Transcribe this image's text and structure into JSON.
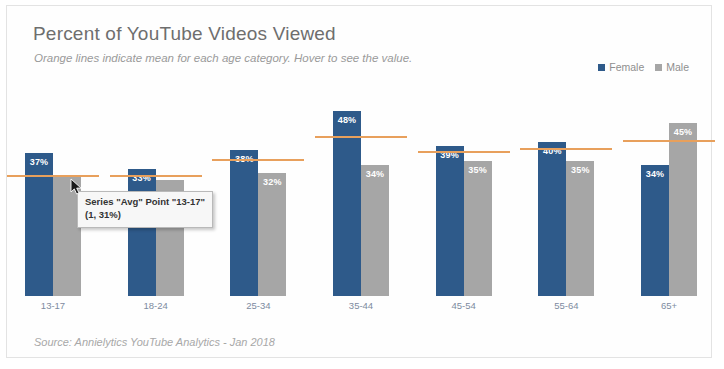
{
  "header": {
    "title": "Percent of YouTube Videos Viewed",
    "subtitle": "Orange lines indicate mean for each age category. Hover to see the value."
  },
  "legend": {
    "position": "top-right",
    "items": [
      {
        "label": "Female",
        "color": "#2e5a8a"
      },
      {
        "label": "Male",
        "color": "#a6a6a6"
      }
    ]
  },
  "tooltip": {
    "line1": "Series \"Avg\" Point \"13-17\"",
    "line2": "(1, 31%)"
  },
  "source": "Source: Annielytics YouTube Analytics - Jan 2018",
  "colors": {
    "female": "#2e5a8a",
    "male": "#a6a6a6",
    "mean_line": "#e8a05c",
    "title_text": "#6e6e6e",
    "axis_label": "#7d8ba0",
    "card_border": "#e3e3e3"
  },
  "chart_data": {
    "type": "bar",
    "title": "Percent of YouTube Videos Viewed",
    "subtitle": "Orange lines indicate mean for each age category. Hover to see the value.",
    "xlabel": "",
    "ylabel": "",
    "ylim": [
      0,
      55
    ],
    "grid": false,
    "legend_position": "top-right",
    "categories": [
      "13-17",
      "18-24",
      "25-34",
      "35-44",
      "45-54",
      "55-64",
      "65+"
    ],
    "series": [
      {
        "name": "Female",
        "color": "#2e5a8a",
        "values": [
          37,
          33,
          38,
          48,
          39,
          40,
          34
        ],
        "labels": [
          "37%",
          "33%",
          "38%",
          "48%",
          "39%",
          "40%",
          "34%"
        ]
      },
      {
        "name": "Male",
        "color": "#a6a6a6",
        "values": [
          31,
          30,
          32,
          34,
          35,
          35,
          45
        ],
        "labels": [
          "",
          "",
          "32%",
          "34%",
          "35%",
          "35%",
          "45%"
        ]
      }
    ],
    "mean_series": {
      "name": "Avg",
      "color": "#e8a05c",
      "values": [
        31,
        31,
        35,
        41,
        37,
        38,
        40
      ],
      "labels": [
        "31%",
        "31%",
        "35%",
        "41%",
        "37%",
        "38%",
        "40%"
      ]
    },
    "annotations": [
      {
        "type": "tooltip",
        "text": "Series \"Avg\" Point \"13-17\" (1, 31%)",
        "category": "13-17"
      }
    ]
  }
}
